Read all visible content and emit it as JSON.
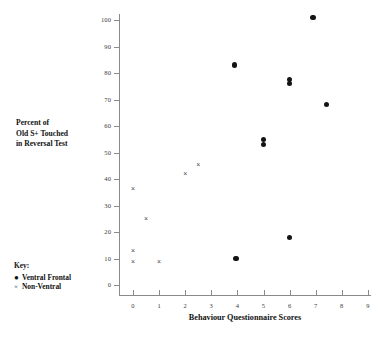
{
  "chart_data": {
    "type": "scatter",
    "title": "",
    "xlabel": "Behaviour Questionnaire Scores",
    "ylabel": "Percent of Old S+ Touched in Reversal Test",
    "ylabel_lines": [
      "Percent of",
      "Old S+ Touched",
      "in Reversal Test"
    ],
    "xlim": [
      0,
      9
    ],
    "ylim": [
      0,
      100
    ],
    "xticks": [
      0,
      1,
      2,
      3,
      4,
      5,
      6,
      7,
      8,
      9
    ],
    "yticks": [
      0,
      10,
      20,
      30,
      40,
      50,
      60,
      70,
      80,
      90,
      100
    ],
    "xtick_labels": [
      "0",
      "1",
      "2",
      "3",
      "4",
      "5",
      "6",
      "7",
      "8",
      "9"
    ],
    "ytick_labels": [
      "0",
      "10",
      "20",
      "30",
      "40",
      "50",
      "60",
      "70",
      "80",
      "90",
      "100"
    ],
    "grid": false,
    "legend_position": "lower-left-outside",
    "series": [
      {
        "name": "Ventral Frontal",
        "marker": "filled-circle",
        "color": "#141414",
        "points": [
          {
            "x": 3.95,
            "y": 10
          },
          {
            "x": 3.9,
            "y": 83
          },
          {
            "x": 5.0,
            "y": 53
          },
          {
            "x": 5.0,
            "y": 55
          },
          {
            "x": 6.0,
            "y": 18
          },
          {
            "x": 6.0,
            "y": 76
          },
          {
            "x": 6.0,
            "y": 77.5
          },
          {
            "x": 6.9,
            "y": 101
          },
          {
            "x": 7.4,
            "y": 68
          }
        ]
      },
      {
        "name": "Non-Ventral",
        "marker": "x",
        "color": "#4a4a4a",
        "points": [
          {
            "x": 0.0,
            "y": 9
          },
          {
            "x": 0.0,
            "y": 13
          },
          {
            "x": 0.0,
            "y": 36.5
          },
          {
            "x": 0.5,
            "y": 25
          },
          {
            "x": 1.0,
            "y": 9
          },
          {
            "x": 2.0,
            "y": 42
          },
          {
            "x": 2.5,
            "y": 45.5
          }
        ]
      }
    ]
  },
  "legend": {
    "title": "Key:",
    "entries": [
      {
        "symbol": "●",
        "symbol_name": "filled-circle-marker",
        "label": "Ventral Frontal"
      },
      {
        "symbol": "×",
        "symbol_name": "x-marker",
        "label": "Non-Ventral"
      }
    ]
  }
}
